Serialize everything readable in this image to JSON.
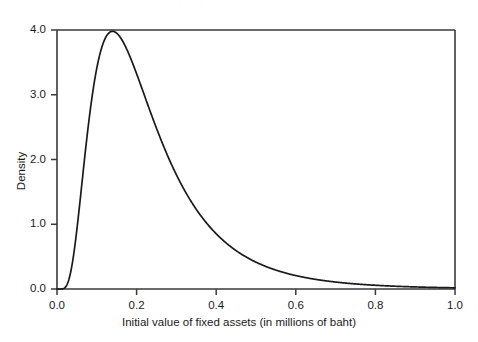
{
  "figure": {
    "background_color": "#ffffff",
    "line_color": "#1a1a1a",
    "axis_color": "#3a3a3a",
    "top_artifact_text": "··· ···"
  },
  "chart_data": {
    "type": "line",
    "title": "",
    "subtitle": "",
    "xlabel": "Initial value of fixed assets (in millions of baht)",
    "ylabel": "Density",
    "xlim": [
      0.0,
      1.0
    ],
    "ylim": [
      0.0,
      4.0
    ],
    "xticks": [
      0.0,
      0.2,
      0.4,
      0.6,
      0.8,
      1.0
    ],
    "xtick_labels": [
      "0.0",
      "0.2",
      "0.4",
      "0.6",
      "0.8",
      "1.0"
    ],
    "yticks": [
      0.0,
      1.0,
      2.0,
      3.0,
      4.0
    ],
    "ytick_labels": [
      "0.0",
      "1.0",
      "2.0",
      "3.0",
      "4.0"
    ],
    "grid": false,
    "legend": null,
    "legend_position": "none",
    "annotations": [],
    "series": [
      {
        "name": "Density of initial fixed assets",
        "distribution": "lognormal",
        "params": {
          "mu": -1.6094,
          "sigma": 0.6
        },
        "peak": {
          "x": 0.135,
          "y": 3.6
        },
        "x": [
          0.0,
          0.01,
          0.02,
          0.03,
          0.04,
          0.05,
          0.06,
          0.07,
          0.08,
          0.09,
          0.1,
          0.11,
          0.12,
          0.13,
          0.135,
          0.14,
          0.15,
          0.16,
          0.17,
          0.18,
          0.19,
          0.2,
          0.22,
          0.24,
          0.26,
          0.28,
          0.3,
          0.32,
          0.34,
          0.36,
          0.38,
          0.4,
          0.44,
          0.48,
          0.52,
          0.56,
          0.6,
          0.65,
          0.7,
          0.75,
          0.8,
          0.85,
          0.9,
          0.95,
          1.0
        ],
        "y": [
          0.0,
          0.02,
          0.28,
          0.86,
          1.54,
          2.17,
          2.68,
          3.06,
          3.31,
          3.47,
          3.55,
          3.58,
          3.59,
          3.6,
          3.6,
          3.59,
          3.55,
          3.49,
          3.41,
          3.32,
          3.22,
          3.11,
          2.88,
          2.64,
          2.4,
          2.17,
          1.95,
          1.75,
          1.56,
          1.39,
          1.24,
          1.1,
          0.87,
          0.68,
          0.53,
          0.42,
          0.33,
          0.24,
          0.18,
          0.13,
          0.1,
          0.07,
          0.05,
          0.04,
          0.03
        ]
      }
    ]
  }
}
